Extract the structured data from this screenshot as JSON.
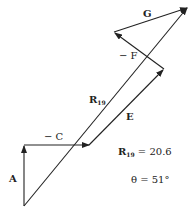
{
  "vectors": [
    {
      "name": "A",
      "label": "A"
    },
    {
      "name": "-C",
      "label": "− C"
    },
    {
      "name": "E",
      "label": "E"
    },
    {
      "name": "-F",
      "label": "− F"
    },
    {
      "name": "G",
      "label": "G"
    },
    {
      "name": "R19",
      "label": "R",
      "sub": "19"
    }
  ],
  "result": {
    "r_label": "R",
    "r_sub": "19",
    "r_value": " = 20.6",
    "theta_text": "θ = 51°"
  },
  "colors": {
    "stroke": "#222222"
  }
}
